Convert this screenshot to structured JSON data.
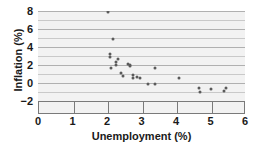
{
  "chart_data": {
    "type": "scatter",
    "title": "",
    "xlabel": "Unemployment (%)",
    "ylabel": "Inflation (%)",
    "xlim": [
      0,
      6
    ],
    "ylim": [
      -2,
      8
    ],
    "xticks": [
      0,
      1,
      2,
      3,
      4,
      5,
      6
    ],
    "yticks": [
      -2,
      0,
      2,
      4,
      6,
      8
    ],
    "xtick_labels": [
      "0",
      "1",
      "2",
      "3",
      "4",
      "5",
      "6"
    ],
    "ytick_labels": [
      "−2",
      "0",
      "2",
      "4",
      "6",
      "8"
    ],
    "grid": "horizontal",
    "legend": "none",
    "marker_color": "#5a5a5a",
    "plot_background": "#f2f2f2",
    "gridline_color": "#c9c9c9",
    "points": [
      {
        "x": 2.02,
        "y": 7.9
      },
      {
        "x": 2.17,
        "y": 4.9
      },
      {
        "x": 2.08,
        "y": 3.2
      },
      {
        "x": 2.08,
        "y": 2.9
      },
      {
        "x": 2.12,
        "y": 1.7
      },
      {
        "x": 2.25,
        "y": 2.3
      },
      {
        "x": 2.32,
        "y": 2.7
      },
      {
        "x": 2.27,
        "y": 2.0
      },
      {
        "x": 2.42,
        "y": 1.1
      },
      {
        "x": 2.45,
        "y": 0.8
      },
      {
        "x": 2.62,
        "y": 2.1
      },
      {
        "x": 2.66,
        "y": 1.9
      },
      {
        "x": 2.68,
        "y": 2.0
      },
      {
        "x": 2.74,
        "y": 0.9
      },
      {
        "x": 2.76,
        "y": 0.6
      },
      {
        "x": 2.88,
        "y": 0.7
      },
      {
        "x": 2.95,
        "y": 0.6
      },
      {
        "x": 3.18,
        "y": -0.1
      },
      {
        "x": 3.38,
        "y": 1.7
      },
      {
        "x": 3.4,
        "y": -0.1
      },
      {
        "x": 4.08,
        "y": 0.6
      },
      {
        "x": 4.68,
        "y": -0.6
      },
      {
        "x": 4.7,
        "y": -1.0
      },
      {
        "x": 5.0,
        "y": -0.7
      },
      {
        "x": 5.38,
        "y": -0.9
      },
      {
        "x": 5.45,
        "y": -0.5
      }
    ]
  }
}
